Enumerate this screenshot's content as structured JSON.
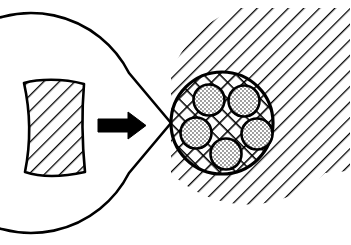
{
  "figure": {
    "title": "Wedge segment inserted into hatched annular disc with cross-hatched fibrous core",
    "background_color": "#ffffff",
    "stroke_color": "#000000",
    "canvas": {
      "width": 351,
      "height": 245
    },
    "elements": [
      {
        "name": "wedge-segment",
        "role": "detached sector piece shown at left",
        "fill_pattern": "diagonal-hatch",
        "pattern_angle_deg": 45,
        "center_x": 53,
        "center_y": 126,
        "label": ""
      },
      {
        "name": "transfer-arrow",
        "role": "indicates insertion direction of the wedge into the notch",
        "direction": "right",
        "color": "#000000",
        "tail_x": 98,
        "tip_x": 144,
        "y": 125,
        "label": ""
      },
      {
        "name": "outer-disc",
        "role": "notched circular matrix body",
        "fill_pattern": "diagonal-hatch",
        "pattern_angle_deg": 45,
        "center_x": 227,
        "center_y": 123,
        "radius": 110,
        "notch_half_angle_deg": 27,
        "label": ""
      },
      {
        "name": "inner-core-circle",
        "role": "cross-hatched core region",
        "fill_pattern": "cross-hatch",
        "center_x": 222,
        "center_y": 123,
        "radius": 51,
        "label": ""
      },
      {
        "name": "stippled-inclusion",
        "role": "dotted circular inclusions inside the core",
        "fill_pattern": "stipple",
        "count": 5,
        "radius": 15,
        "positions": [
          {
            "cx": 209,
            "cy": 100
          },
          {
            "cx": 244,
            "cy": 101
          },
          {
            "cx": 196,
            "cy": 133
          },
          {
            "cx": 257,
            "cy": 134
          },
          {
            "cx": 226,
            "cy": 154
          }
        ],
        "label": ""
      }
    ],
    "colors": {
      "line": "#000000",
      "fill": "#ffffff",
      "stipple": "#1a1a1a",
      "arrow": "#000000"
    },
    "captions": []
  }
}
